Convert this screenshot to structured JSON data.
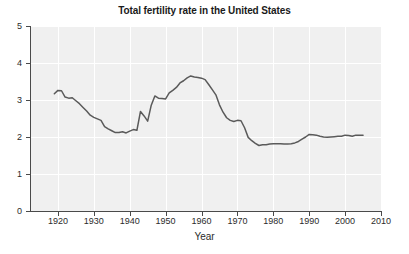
{
  "chart_data": {
    "type": "line",
    "title": "Total fertility rate in the United States",
    "xlabel": "Year",
    "ylabel": "",
    "xlim": [
      1912.5,
      2010
    ],
    "ylim": [
      0,
      5
    ],
    "grid": true,
    "legend": "none",
    "xticks": [
      1920,
      1930,
      1940,
      1950,
      1960,
      1970,
      1980,
      1990,
      2000,
      2010
    ],
    "xtick_labels": [
      "1920",
      "1930",
      "1940",
      "1950",
      "1960",
      "1970",
      "1980",
      "1990",
      "2000",
      "2010"
    ],
    "yticks": [
      0,
      1,
      2,
      3,
      4,
      5
    ],
    "ytick_labels": [
      "0",
      "1",
      "2",
      "3",
      "4",
      "5"
    ],
    "series": [
      {
        "name": "Total fertility rate",
        "color": "#5a5a5a",
        "x": [
          1919,
          1920,
          1921,
          1922,
          1923,
          1924,
          1925,
          1926,
          1927,
          1928,
          1929,
          1930,
          1931,
          1932,
          1933,
          1934,
          1935,
          1936,
          1937,
          1938,
          1939,
          1940,
          1941,
          1942,
          1943,
          1944,
          1945,
          1946,
          1947,
          1948,
          1949,
          1950,
          1951,
          1952,
          1953,
          1954,
          1955,
          1956,
          1957,
          1958,
          1959,
          1960,
          1961,
          1962,
          1963,
          1964,
          1965,
          1966,
          1967,
          1968,
          1969,
          1970,
          1971,
          1972,
          1973,
          1974,
          1975,
          1976,
          1977,
          1978,
          1979,
          1980,
          1981,
          1982,
          1983,
          1984,
          1985,
          1986,
          1987,
          1988,
          1989,
          1990,
          1991,
          1992,
          1993,
          1994,
          1995,
          1996,
          1997,
          1998,
          1999,
          2000,
          2001,
          2002,
          2003,
          2004,
          2005
        ],
        "values": [
          3.17,
          3.26,
          3.25,
          3.08,
          3.05,
          3.06,
          2.98,
          2.9,
          2.8,
          2.7,
          2.59,
          2.53,
          2.49,
          2.45,
          2.28,
          2.22,
          2.17,
          2.12,
          2.12,
          2.14,
          2.11,
          2.16,
          2.2,
          2.18,
          2.69,
          2.57,
          2.43,
          2.86,
          3.11,
          3.05,
          3.04,
          3.03,
          3.19,
          3.26,
          3.34,
          3.46,
          3.52,
          3.6,
          3.65,
          3.62,
          3.61,
          3.59,
          3.55,
          3.42,
          3.28,
          3.14,
          2.87,
          2.67,
          2.52,
          2.45,
          2.42,
          2.45,
          2.44,
          2.25,
          1.99,
          1.9,
          1.83,
          1.77,
          1.79,
          1.79,
          1.81,
          1.82,
          1.82,
          1.82,
          1.81,
          1.81,
          1.82,
          1.84,
          1.88,
          1.94,
          2.0,
          2.07,
          2.06,
          2.05,
          2.02,
          2.0,
          1.99,
          2.0,
          2.01,
          2.02,
          2.02,
          2.05,
          2.04,
          2.02,
          2.05,
          2.05,
          2.05
        ],
        "peak_baby_boom": {
          "year": 1957,
          "value": 3.65
        },
        "trough_depression": {
          "year": 1936,
          "value": 2.12
        },
        "trough_1976": {
          "year": 1976,
          "value": 1.77
        }
      }
    ]
  },
  "colors": {
    "plot_background": "#f0f0f0",
    "gridline": "#ffffff",
    "axis": "#4a4a4a",
    "line": "#5a5a5a",
    "text": "#2b2b2b",
    "page_background": "#ffffff"
  }
}
